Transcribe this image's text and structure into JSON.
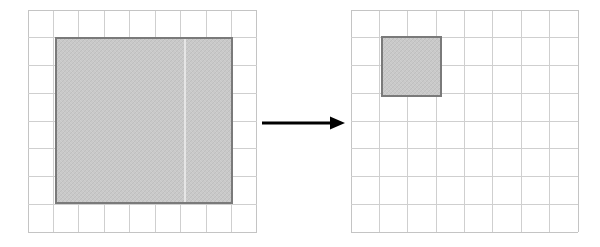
{
  "figure": {
    "background_color": "#ffffff",
    "grid_line_color": "#cfcfcf",
    "region_fill_color": "#c9c9c9",
    "region_border_color": "#7a7a7a",
    "arrow_color": "#000000"
  },
  "panels": [
    {
      "id": "source-panel",
      "label": "source grid",
      "position": {
        "x": 28,
        "y": 10
      },
      "size": {
        "width": 229,
        "height": 222
      },
      "grid": {
        "columns": 9,
        "rows": 8,
        "cell_width": 25.44,
        "cell_height": 27.75
      },
      "region": {
        "label": "selected region",
        "x": 56,
        "y": 38,
        "width": 176,
        "height": 165,
        "fill": "#c9c9c9",
        "border": "#7a7a7a",
        "seam_x": 185,
        "seam_color": "#f2f2f2"
      }
    },
    {
      "id": "target-panel",
      "label": "target grid",
      "position": {
        "x": 351,
        "y": 10
      },
      "size": {
        "width": 227,
        "height": 222
      },
      "grid": {
        "columns": 8,
        "rows": 8,
        "cell_width": 28.38,
        "cell_height": 27.75
      },
      "region": {
        "label": "scaled region",
        "x": 382,
        "y": 37,
        "width": 59,
        "height": 59,
        "fill": "#c9c9c9",
        "border": "#7a7a7a"
      }
    }
  ],
  "arrow": {
    "label": "transform arrow",
    "x1": 262,
    "y1": 123,
    "x2": 345,
    "y2": 123,
    "head_length": 15,
    "head_width": 13,
    "color": "#000000"
  }
}
